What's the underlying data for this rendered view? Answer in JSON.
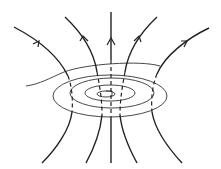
{
  "diagram": {
    "title": "",
    "colors": {
      "line": "#222222",
      "coil": "#333333",
      "background": "#ffffff"
    },
    "field_lines": [
      {
        "id": "far-left",
        "direction": "up"
      },
      {
        "id": "left",
        "direction": "up"
      },
      {
        "id": "center",
        "direction": "up"
      },
      {
        "id": "right",
        "direction": "up"
      },
      {
        "id": "far-right",
        "direction": "up"
      }
    ],
    "coil": {
      "turns": 3,
      "shape": "flat-spiral"
    }
  }
}
